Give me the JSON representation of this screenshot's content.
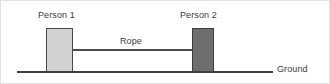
{
  "diagram": {
    "background_color": "#ffffff",
    "border_color": "#e2e2e2",
    "labels": {
      "person1": "Person 1",
      "person2": "Person 2",
      "rope": "Rope",
      "ground": "Ground"
    },
    "objects": {
      "person1_block": {
        "name": "Person 1",
        "fill_color": "#d2d2d2",
        "stroke_color": "#4a4a4a"
      },
      "person2_block": {
        "name": "Person 2",
        "fill_color": "#6e6e6e",
        "stroke_color": "#3c3c3c"
      },
      "rope_line": {
        "name": "Rope",
        "stroke_color": "#4a4a4a"
      },
      "ground_line": {
        "name": "Ground",
        "stroke_color": "#3f3f3f"
      }
    }
  }
}
